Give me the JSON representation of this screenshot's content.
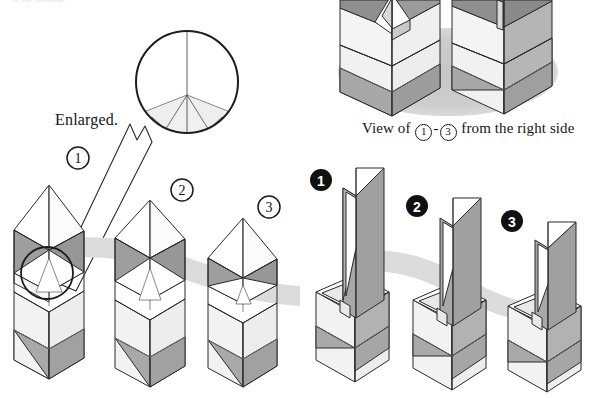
{
  "page": {
    "width": 589,
    "height": 398,
    "background": "#ffffff",
    "kind": "origami-folding-instruction-diagram",
    "top_cut_text": "to the bottom."
  },
  "labels": {
    "enlarged": "Enlarged.",
    "right_view_caption_prefix": "View of ",
    "right_view_caption_mid": "-",
    "right_view_caption_suffix": " from the right side",
    "circle_one": "1",
    "circle_three": "3"
  },
  "steps_open": {
    "items": [
      {
        "number": "1",
        "style": "outline-circle",
        "x": 78,
        "y": 158
      },
      {
        "number": "2",
        "style": "outline-circle",
        "x": 182,
        "y": 190
      },
      {
        "number": "3",
        "style": "outline-circle",
        "x": 269,
        "y": 207
      }
    ]
  },
  "steps_solid": {
    "items": [
      {
        "number": "1",
        "style": "solid-circle",
        "x": 321,
        "y": 180
      },
      {
        "number": "2",
        "style": "solid-circle",
        "x": 417,
        "y": 206
      },
      {
        "number": "3",
        "style": "solid-circle",
        "x": 512,
        "y": 221
      }
    ]
  },
  "colors": {
    "paper_front": "#f2f2f2",
    "paper_white": "#ffffff",
    "paper_back_dark": "#a2a2a2",
    "paper_back_mid": "#b9b9b9",
    "paper_light_gray": "#e4e4e4",
    "outline": "#2a2a2a",
    "shadow": "#d5d5d5",
    "ground_ellipse": "#cfcfcf",
    "text": "#151515",
    "solid_badge_fill": "#111111",
    "solid_badge_text": "#ffffff"
  },
  "regions": {
    "enlarged_circle": {
      "cx": 187,
      "cy": 82,
      "r": 52,
      "description": "enlarged detail of tip area"
    },
    "detail_circle": {
      "cx": 47,
      "cy": 273,
      "r": 26,
      "description": "circle marking the area enlarged"
    },
    "right_side_ground": {
      "cx": 448,
      "cy": 72,
      "rx": 109,
      "ry": 43
    }
  }
}
